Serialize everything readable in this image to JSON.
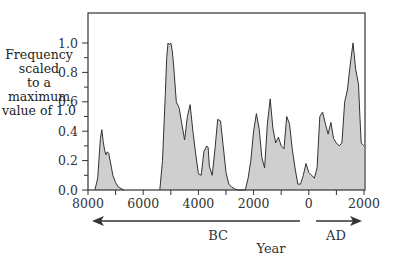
{
  "chart_data": {
    "type": "area",
    "title": "",
    "xlabel": "Year",
    "ylabel": "Frequency scaled to a maximum value of 1.0",
    "ylabel_lines": [
      "Frequency scaled",
      "to a maximum",
      "value of 1.0"
    ],
    "x_tick_labels": [
      "8000",
      "6000",
      "4000",
      "2000",
      "0",
      "2000"
    ],
    "y_tick_labels": [
      "0.0",
      "0.2",
      "0.4",
      "0.6",
      "0.8",
      "1.0"
    ],
    "era_labels": {
      "bc": "BC",
      "ad": "AD"
    },
    "xlim": [
      -8000,
      2000
    ],
    "ylim": [
      0,
      1.0
    ],
    "grid": false,
    "fill_color": "#cfcfcf",
    "line_color": "#333333",
    "series": [
      {
        "name": "frequency",
        "x": [
          -7750,
          -7650,
          -7550,
          -7500,
          -7450,
          -7400,
          -7350,
          -7300,
          -7250,
          -7200,
          -7150,
          -7100,
          -7000,
          -6900,
          -6800,
          -6700,
          -5400,
          -5300,
          -5200,
          -5150,
          -5100,
          -5050,
          -5000,
          -4950,
          -4900,
          -4800,
          -4700,
          -4600,
          -4500,
          -4400,
          -4300,
          -4200,
          -4100,
          -4000,
          -3900,
          -3800,
          -3700,
          -3650,
          -3600,
          -3500,
          -3400,
          -3300,
          -3200,
          -3100,
          -3000,
          -2900,
          -2800,
          -2700,
          -2600,
          -2300,
          -2200,
          -2100,
          -2000,
          -1900,
          -1800,
          -1700,
          -1600,
          -1500,
          -1400,
          -1300,
          -1200,
          -1100,
          -1000,
          -900,
          -800,
          -700,
          -600,
          -500,
          -400,
          -300,
          -200,
          -100,
          0,
          100,
          200,
          300,
          400,
          500,
          600,
          700,
          800,
          900,
          1000,
          1100,
          1200,
          1300,
          1400,
          1500,
          1600,
          1700,
          1800,
          1850,
          1900,
          2000
        ],
        "values": [
          0.0,
          0.08,
          0.35,
          0.41,
          0.33,
          0.27,
          0.24,
          0.26,
          0.25,
          0.2,
          0.15,
          0.1,
          0.05,
          0.02,
          0.01,
          0.0,
          0.0,
          0.2,
          0.65,
          0.9,
          1.0,
          0.99,
          1.0,
          0.95,
          0.85,
          0.6,
          0.56,
          0.45,
          0.34,
          0.5,
          0.58,
          0.4,
          0.25,
          0.11,
          0.1,
          0.26,
          0.3,
          0.29,
          0.16,
          0.1,
          0.28,
          0.48,
          0.47,
          0.3,
          0.12,
          0.04,
          0.02,
          0.01,
          0.0,
          0.0,
          0.08,
          0.2,
          0.4,
          0.52,
          0.42,
          0.22,
          0.15,
          0.45,
          0.62,
          0.42,
          0.32,
          0.36,
          0.3,
          0.28,
          0.5,
          0.45,
          0.28,
          0.15,
          0.04,
          0.04,
          0.1,
          0.18,
          0.12,
          0.1,
          0.08,
          0.15,
          0.5,
          0.53,
          0.45,
          0.38,
          0.46,
          0.35,
          0.32,
          0.3,
          0.32,
          0.6,
          0.68,
          0.85,
          1.0,
          0.82,
          0.72,
          0.5,
          0.32,
          0.3
        ]
      }
    ]
  }
}
